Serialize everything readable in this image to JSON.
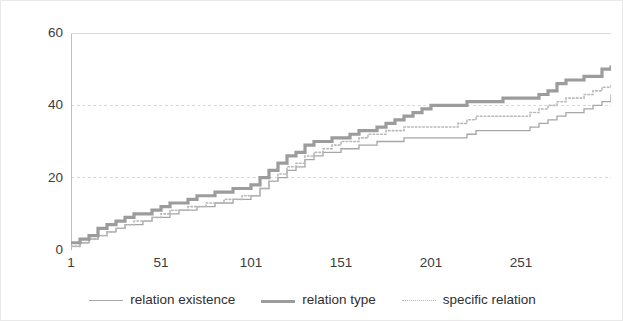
{
  "chart_data": {
    "type": "line",
    "title": "",
    "subtitle": "",
    "xlabel": "",
    "ylabel": "",
    "xlim": [
      1,
      301
    ],
    "ylim": [
      0,
      60
    ],
    "grid": true,
    "grid_style": "dashed-horizontal",
    "legend_position": "bottom-center",
    "x_ticks": [
      1,
      51,
      101,
      151,
      201,
      251
    ],
    "x_tick_labels": [
      "1",
      "51",
      "101",
      "151",
      "201",
      "251"
    ],
    "y_ticks": [
      0,
      20,
      40,
      60
    ],
    "y_tick_labels": [
      "0",
      "20",
      "40",
      "60"
    ],
    "series": [
      {
        "name": "relation existence",
        "color": "#a6a6a6",
        "style": "solid-thin",
        "x": [
          1,
          6,
          11,
          16,
          21,
          26,
          31,
          36,
          41,
          46,
          51,
          56,
          61,
          66,
          71,
          76,
          81,
          86,
          91,
          96,
          101,
          106,
          111,
          116,
          121,
          126,
          131,
          136,
          141,
          146,
          151,
          156,
          161,
          166,
          171,
          176,
          181,
          186,
          191,
          196,
          201,
          206,
          211,
          216,
          221,
          226,
          231,
          236,
          241,
          246,
          251,
          256,
          261,
          266,
          271,
          276,
          281,
          286,
          291,
          296,
          301
        ],
        "values": [
          1,
          2,
          3,
          4,
          5,
          6,
          7,
          7,
          8,
          9,
          9,
          10,
          11,
          11,
          12,
          12,
          13,
          13,
          14,
          14,
          15,
          17,
          19,
          20,
          22,
          23,
          25,
          26,
          27,
          27,
          28,
          28,
          29,
          29,
          30,
          30,
          30,
          31,
          31,
          31,
          31,
          31,
          31,
          31,
          32,
          33,
          33,
          33,
          33,
          33,
          33,
          34,
          35,
          36,
          37,
          38,
          38,
          39,
          40,
          41,
          43
        ]
      },
      {
        "name": "relation type",
        "color": "#9c9c9c",
        "style": "solid-thick",
        "x": [
          1,
          6,
          11,
          16,
          21,
          26,
          31,
          36,
          41,
          46,
          51,
          56,
          61,
          66,
          71,
          76,
          81,
          86,
          91,
          96,
          101,
          106,
          111,
          116,
          121,
          126,
          131,
          136,
          141,
          146,
          151,
          156,
          161,
          166,
          171,
          176,
          181,
          186,
          191,
          196,
          201,
          206,
          211,
          216,
          221,
          226,
          231,
          236,
          241,
          246,
          251,
          256,
          261,
          266,
          271,
          276,
          281,
          286,
          291,
          296,
          301
        ],
        "values": [
          2,
          3,
          4,
          6,
          7,
          8,
          9,
          10,
          10,
          11,
          12,
          13,
          13,
          14,
          15,
          15,
          16,
          16,
          17,
          17,
          18,
          20,
          22,
          24,
          26,
          27,
          29,
          30,
          30,
          31,
          31,
          32,
          33,
          33,
          34,
          35,
          36,
          37,
          38,
          39,
          40,
          40,
          40,
          40,
          41,
          41,
          41,
          41,
          42,
          42,
          42,
          42,
          43,
          44,
          46,
          47,
          47,
          48,
          48,
          50,
          51
        ]
      },
      {
        "name": "specific relation",
        "color": "#b8b8b8",
        "style": "dotted",
        "x": [
          1,
          6,
          11,
          16,
          21,
          26,
          31,
          36,
          41,
          46,
          51,
          56,
          61,
          66,
          71,
          76,
          81,
          86,
          91,
          96,
          101,
          106,
          111,
          116,
          121,
          126,
          131,
          136,
          141,
          146,
          151,
          156,
          161,
          166,
          171,
          176,
          181,
          186,
          191,
          196,
          201,
          206,
          211,
          216,
          221,
          226,
          231,
          236,
          241,
          246,
          251,
          256,
          261,
          266,
          271,
          276,
          281,
          286,
          291,
          296,
          301
        ],
        "values": [
          1,
          2,
          3,
          4,
          5,
          6,
          7,
          8,
          8,
          9,
          10,
          11,
          11,
          12,
          12,
          13,
          13,
          14,
          14,
          15,
          15,
          17,
          19,
          21,
          23,
          24,
          26,
          27,
          28,
          29,
          30,
          30,
          31,
          32,
          32,
          33,
          33,
          34,
          34,
          34,
          34,
          34,
          34,
          35,
          36,
          37,
          37,
          37,
          37,
          37,
          37,
          38,
          39,
          40,
          41,
          42,
          42,
          43,
          44,
          45,
          46
        ]
      }
    ]
  },
  "legend": {
    "items": [
      {
        "label": "relation existence",
        "swatch": "line-thin-swatch"
      },
      {
        "label": "relation type",
        "swatch": "line-thick-swatch"
      },
      {
        "label": "specific relation",
        "swatch": "line-dotted-swatch"
      }
    ]
  },
  "colors": {
    "relation_existence": "#a6a6a6",
    "relation_type": "#9c9c9c",
    "specific_relation": "#b8b8b8",
    "gridline": "#d9d9d9",
    "axis": "#bfbfbf",
    "text": "#3b3b3b",
    "background": "#ffffff",
    "border": "#e9e9e9"
  }
}
